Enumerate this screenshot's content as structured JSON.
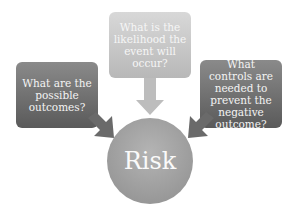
{
  "diagram": {
    "center": {
      "label": "Risk"
    },
    "nodes": [
      {
        "id": "left",
        "label": "What are the possible outcomes?"
      },
      {
        "id": "top",
        "label": "What is the likelihood the event will occur?"
      },
      {
        "id": "right",
        "label": "What controls are needed to prevent the negative outcome?"
      }
    ],
    "edges": [
      {
        "from": "left",
        "to": "center"
      },
      {
        "from": "top",
        "to": "center"
      },
      {
        "from": "right",
        "to": "center"
      }
    ],
    "colors": {
      "dark_box": "#6e6e6e",
      "light_box": "#c8c8c8",
      "circle": "#a0a0a0",
      "text": "#f4f4f4"
    }
  }
}
